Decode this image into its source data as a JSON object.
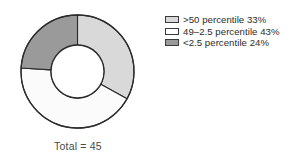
{
  "figure": {
    "caption": "Total = 45",
    "background_color": "#ffffff"
  },
  "legend": {
    "position": "right",
    "items": [
      {
        "label": ">50 percentile 33%",
        "swatch_name": "legend-swatch-above-50",
        "color": "#d9d9d9"
      },
      {
        "label": "49–2.5 percentile 43%",
        "swatch_name": "legend-swatch-49-to-2-5",
        "color": "#ffffff"
      },
      {
        "label": "<2.5 percentile 24%",
        "swatch_name": "legend-swatch-below-2-5",
        "color": "#9a9a9a"
      }
    ]
  },
  "chart_data": {
    "type": "pie",
    "variant": "donut",
    "title": "",
    "subtitle": "",
    "caption": "Total = 45",
    "total": 45,
    "unit": "%",
    "categories": [
      ">50 percentile",
      "49–2.5 percentile",
      "<2.5 percentile"
    ],
    "values": [
      33,
      43,
      24
    ],
    "labels": [
      ">50 percentile 33%",
      "49–2.5 percentile 43%",
      "<2.5 percentile 24%"
    ],
    "colors": [
      "#d9d9d9",
      "#fbfbfb",
      "#9a9a9a"
    ],
    "start_angle_deg": 0,
    "direction": "clockwise",
    "inner_radius_ratio": 0.47,
    "stroke_color": "#2b2b2b",
    "legend_position": "right",
    "grid": false,
    "xlabel": "",
    "ylabel": ""
  }
}
